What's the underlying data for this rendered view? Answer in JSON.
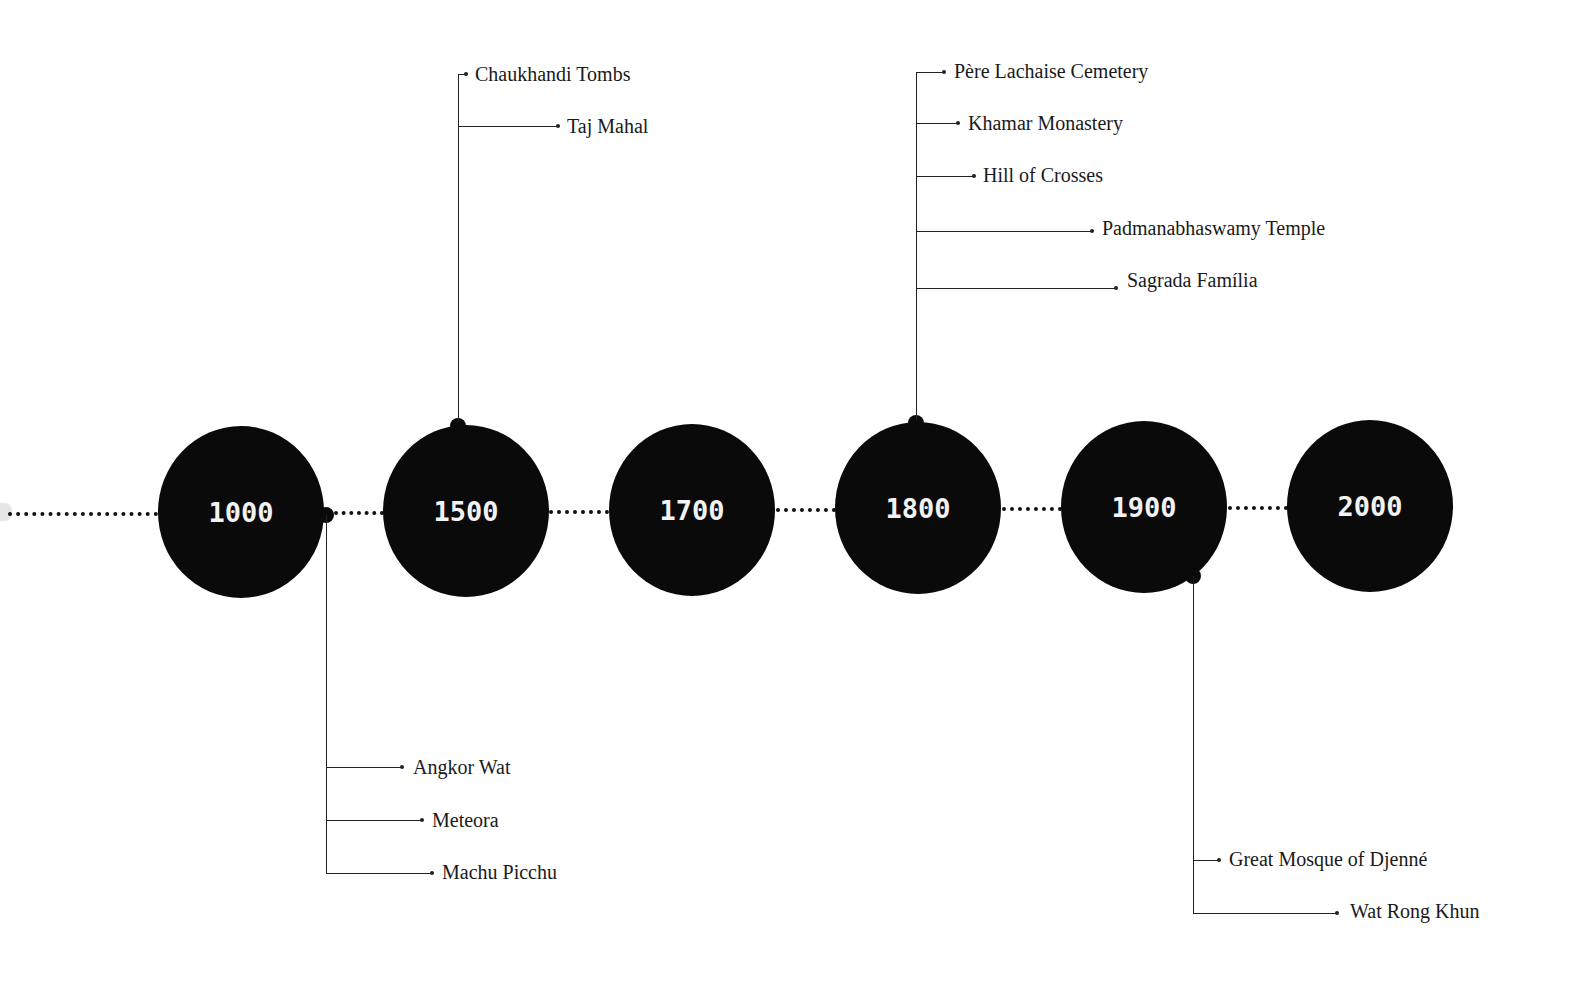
{
  "timeline": {
    "nodes": [
      {
        "year": "1000",
        "cx": 241,
        "cy": 512
      },
      {
        "year": "1500",
        "cx": 466,
        "cy": 511
      },
      {
        "year": "1700",
        "cx": 692,
        "cy": 510
      },
      {
        "year": "1800",
        "cx": 918,
        "cy": 508
      },
      {
        "year": "1900",
        "cx": 1144,
        "cy": 507
      },
      {
        "year": "2000",
        "cx": 1370,
        "cy": 506
      }
    ],
    "branches": [
      {
        "node": "1000",
        "direction": "down",
        "items": [
          "Angkor Wat",
          "Meteora",
          "Machu Picchu"
        ]
      },
      {
        "node": "1500",
        "direction": "up",
        "items": [
          "Chaukhandi Tombs",
          "Taj Mahal"
        ]
      },
      {
        "node": "1800",
        "direction": "up",
        "items": [
          "Père Lachaise Cemetery",
          "Khamar Monastery",
          "Hill of Crosses",
          "Padmanabhaswamy Temple",
          "Sagrada Família"
        ]
      },
      {
        "node": "1900",
        "direction": "down",
        "items": [
          "Great Mosque of Djenné",
          "Wat Rong Khun"
        ]
      }
    ]
  },
  "labels": {
    "angkor": "Angkor Wat",
    "meteora": "Meteora",
    "machu": "Machu Picchu",
    "chaukhandi": "Chaukhandi Tombs",
    "taj": "Taj Mahal",
    "pere": "Père Lachaise Cemetery",
    "khamar": "Khamar Monastery",
    "hill": "Hill of Crosses",
    "padma": "Padmanabhaswamy Temple",
    "sagrada": "Sagrada Família",
    "djenne": "Great Mosque of Djenné",
    "wat": "Wat Rong Khun"
  },
  "years": {
    "y1000": "1000",
    "y1500": "1500",
    "y1700": "1700",
    "y1800": "1800",
    "y1900": "1900",
    "y2000": "2000"
  },
  "colors": {
    "node": "#0a0a0a",
    "node_text": "#f2f2f2",
    "line": "#222222",
    "background": "#ffffff"
  }
}
